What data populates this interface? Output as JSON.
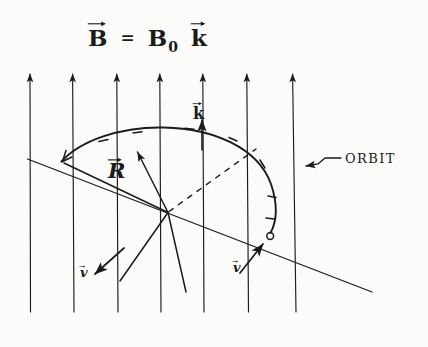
{
  "figure": {
    "kind": "hand-drawn-physics-diagram",
    "ink_color": "#1b1b1b",
    "paper_color": "#fbfbf9"
  },
  "title_equation": {
    "vector_b": "B",
    "equals": "=",
    "magnitude": "B",
    "subscript": "0",
    "unit_vector": "k",
    "plain_text": "B⃗ = B₀ k⃗"
  },
  "labels": {
    "k_vector": "k",
    "radius": "R",
    "orbit": "ORBIT",
    "velocity_left": "v",
    "velocity_right": "v"
  },
  "field_lines": {
    "count": 7,
    "direction": "up",
    "x_positions": [
      30,
      73,
      117,
      160,
      203,
      247,
      293
    ],
    "top_y": 72,
    "bottom_y": 312
  },
  "orbit": {
    "description": "elliptical arc traversed clockwise with direction ticks",
    "start": [
      62,
      161
    ],
    "apex": [
      188,
      129
    ],
    "end_particle": [
      270,
      235
    ],
    "tick_count": 6
  },
  "center_point": [
    168,
    213
  ],
  "diagonal_line": {
    "from": [
      28,
      159
    ],
    "to": [
      372,
      292
    ]
  },
  "dashed_line": {
    "from": [
      168,
      213
    ],
    "to": [
      256,
      149
    ]
  },
  "particle_marker": {
    "shape": "open-circle",
    "center": [
      270,
      236
    ],
    "radius": 3.4
  }
}
